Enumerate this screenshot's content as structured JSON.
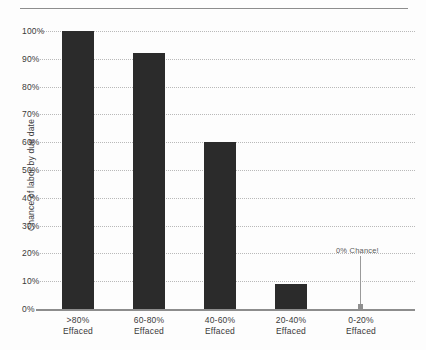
{
  "chart_data": {
    "type": "bar",
    "title": "",
    "xlabel": "",
    "ylabel": "Chance of labor by due date",
    "categories": [
      ">80%\nEffaced",
      "60-80%\nEffaced",
      "40-60%\nEffaced",
      "20-40%\nEffaced",
      "0-20%\nEffaced"
    ],
    "category_lines": [
      [
        "&gt;80%",
        "Effaced"
      ],
      [
        "60-80%",
        "Effaced"
      ],
      [
        "40-60%",
        "Effaced"
      ],
      [
        "20-40%",
        "Effaced"
      ],
      [
        "0-20%",
        "Effaced"
      ]
    ],
    "values": [
      100,
      92,
      60,
      9,
      0
    ],
    "value_labels": [
      "100%",
      "92%",
      "60%",
      "9%",
      "0%"
    ],
    "ylim": [
      0,
      100
    ],
    "ytick_labels": [
      "100%",
      "90%",
      "80%",
      "70%",
      "60%",
      "50%",
      "40%",
      "30%",
      "20%",
      "10%",
      "0%"
    ],
    "ytick_values": [
      100,
      90,
      80,
      70,
      60,
      50,
      40,
      30,
      20,
      10,
      0
    ],
    "grid": "horizontal-dotted",
    "legend": "none",
    "annotations": [
      {
        "text": "0% Chance!",
        "category": "0-20% Effaced",
        "value": 0
      }
    ],
    "colors": {
      "bar": "#2b2b2b",
      "gridline": "#b9b9b9",
      "axis": "#8d8d8d",
      "text": "#3a3a3a",
      "annotation": "#5a5a5a"
    }
  },
  "ticks": {
    "y": [
      {
        "label": "100%"
      },
      {
        "label": "90%"
      },
      {
        "label": "80%"
      },
      {
        "label": "70%"
      },
      {
        "label": "60%"
      },
      {
        "label": "50%"
      },
      {
        "label": "40%"
      },
      {
        "label": "30%"
      },
      {
        "label": "20%"
      },
      {
        "label": "10%"
      },
      {
        "label": "0%"
      }
    ]
  },
  "axis": {
    "y_title": "Chance of labor by due date"
  },
  "annotation": {
    "label": "0% Chance!"
  }
}
